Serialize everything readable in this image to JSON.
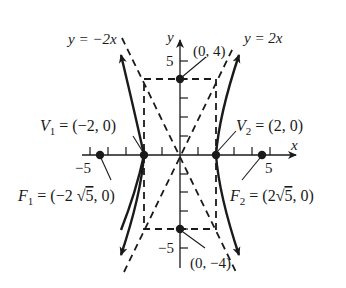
{
  "figure": {
    "type": "hyperbola",
    "equation": "x^2/4 - y^2/16 = 1",
    "axes": {
      "x_label": "x",
      "y_label": "y",
      "x_tick_labels": [
        "−5",
        "5"
      ],
      "y_tick_labels": [
        "5",
        "−5"
      ],
      "x_range": [
        -5.5,
        6
      ],
      "y_range": [
        -5.5,
        5.5
      ]
    },
    "asymptotes": [
      {
        "label": "y = −2x",
        "slope": -2
      },
      {
        "label": "y = 2x",
        "slope": 2
      }
    ],
    "points": {
      "V1": {
        "label_sym": "V",
        "sub": "1",
        "text": " = (−2, 0)",
        "x": -2,
        "y": 0
      },
      "V2": {
        "label_sym": "V",
        "sub": "2",
        "text": " = (2, 0)",
        "x": 2,
        "y": 0
      },
      "F1": {
        "label_sym": "F",
        "sub": "1",
        "text_pre": " = (−2 ",
        "root": "5",
        "text_post": ", 0)",
        "x": -4.472,
        "y": 0
      },
      "F2": {
        "label_sym": "F",
        "sub": "2",
        "text_pre": " = (2",
        "root": "5",
        "text_post": ", 0)",
        "x": 4.472,
        "y": 0
      },
      "top": {
        "text": "(0, 4)",
        "x": 0,
        "y": 4
      },
      "bottom": {
        "text": "(0, −4)",
        "x": 0,
        "y": -4
      }
    },
    "fundamental_rectangle": {
      "x": [
        -2,
        2
      ],
      "y": [
        -4,
        4
      ]
    },
    "colors": {
      "ink": "#1a1a1a",
      "background": "#ffffff"
    }
  }
}
